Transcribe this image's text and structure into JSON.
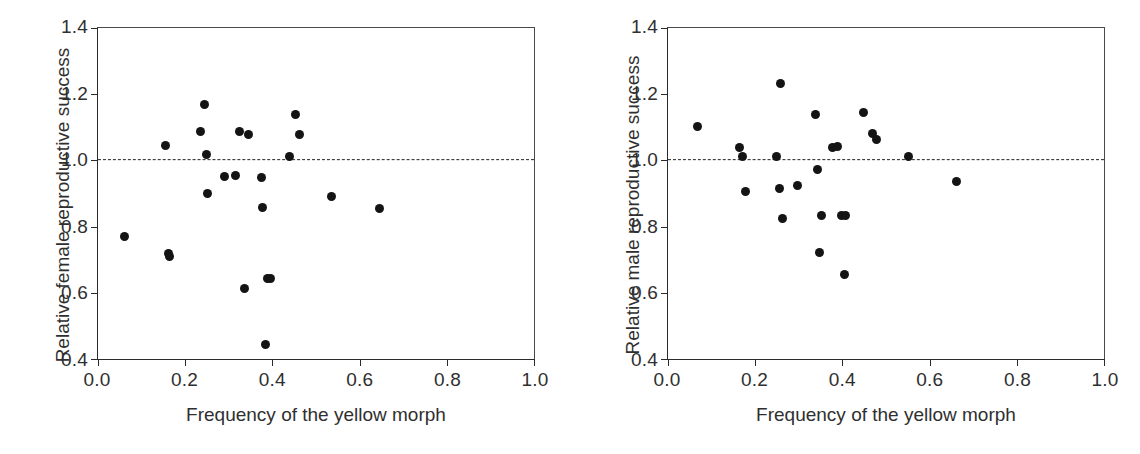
{
  "figure": {
    "background": "#ffffff",
    "point_color": "#141414",
    "axis_color": "#2b2b2b",
    "reference_line_color": "#222222"
  },
  "panels": [
    {
      "id": "panel-left",
      "name": "female-reproductive-success-scatter",
      "x_title": "Frequency of the yellow morph",
      "y_title": "Relative female reproductive success",
      "x_ticks": [
        "0.0",
        "0.2",
        "0.4",
        "0.6",
        "0.8",
        "1.0"
      ],
      "y_ticks": [
        "0.4",
        "0.6",
        "0.8",
        "1.0",
        "1.2",
        "1.4"
      ]
    },
    {
      "id": "panel-right",
      "name": "male-reproductive-success-scatter",
      "x_title": "Frequency of the yellow morph",
      "y_title": "Relative male reproductive success",
      "x_ticks": [
        "0.0",
        "0.2",
        "0.4",
        "0.6",
        "0.8",
        "1.0"
      ],
      "y_ticks": [
        "0.4",
        "0.6",
        "0.8",
        "1.0",
        "1.2",
        "1.4"
      ]
    }
  ],
  "chart_data": [
    {
      "type": "scatter",
      "panel": "left",
      "title": "",
      "xlabel": "Frequency of the yellow morph",
      "ylabel": "Relative female reproductive success",
      "xlim": [
        0.0,
        1.0
      ],
      "ylim": [
        0.4,
        1.4
      ],
      "xticks": [
        0.0,
        0.2,
        0.4,
        0.6,
        0.8,
        1.0
      ],
      "yticks": [
        0.4,
        0.6,
        0.8,
        1.0,
        1.2,
        1.4
      ],
      "grid": false,
      "legend": null,
      "reference_line": {
        "orientation": "horizontal",
        "y": 1.0,
        "style": "dashed"
      },
      "x": [
        0.06,
        0.155,
        0.162,
        0.163,
        0.235,
        0.245,
        0.248,
        0.252,
        0.29,
        0.315,
        0.325,
        0.335,
        0.345,
        0.375,
        0.378,
        0.385,
        0.388,
        0.395,
        0.44,
        0.452,
        0.462,
        0.535,
        0.645
      ],
      "y": [
        0.77,
        1.045,
        0.72,
        0.71,
        1.088,
        1.168,
        1.018,
        0.9,
        0.95,
        0.955,
        1.088,
        0.613,
        1.077,
        0.948,
        0.858,
        0.445,
        0.642,
        0.642,
        1.012,
        1.14,
        1.078,
        0.89,
        0.855
      ],
      "n_points": 23
    },
    {
      "type": "scatter",
      "panel": "right",
      "title": "",
      "xlabel": "Frequency of the yellow morph",
      "ylabel": "Relative male reproductive success",
      "xlim": [
        0.0,
        1.0
      ],
      "ylim": [
        0.4,
        1.4
      ],
      "xticks": [
        0.0,
        0.2,
        0.4,
        0.6,
        0.8,
        1.0
      ],
      "yticks": [
        0.4,
        0.6,
        0.8,
        1.0,
        1.2,
        1.4
      ],
      "grid": false,
      "legend": null,
      "reference_line": {
        "orientation": "horizontal",
        "y": 1.0,
        "style": "dashed"
      },
      "x": [
        0.068,
        0.165,
        0.172,
        0.178,
        0.248,
        0.255,
        0.258,
        0.262,
        0.298,
        0.338,
        0.342,
        0.348,
        0.352,
        0.378,
        0.388,
        0.398,
        0.405,
        0.408,
        0.448,
        0.468,
        0.478,
        0.552,
        0.662
      ],
      "y": [
        1.102,
        1.038,
        1.012,
        0.905,
        1.012,
        0.915,
        1.232,
        0.825,
        0.925,
        1.14,
        0.972,
        0.722,
        0.835,
        1.04,
        1.042,
        0.835,
        0.655,
        0.835,
        1.145,
        1.082,
        1.062,
        1.012,
        0.935
      ],
      "n_points": 23
    }
  ]
}
